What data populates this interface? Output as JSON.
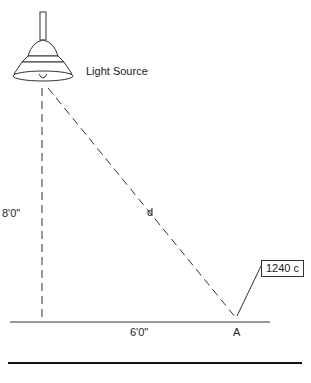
{
  "diagram": {
    "light_source_label": "Light Source",
    "vertical_distance_label": "8'0\"",
    "horizontal_distance_label": "6'0\"",
    "hypotenuse_label": "d",
    "point_label": "A",
    "callout_value": "1240 c"
  }
}
